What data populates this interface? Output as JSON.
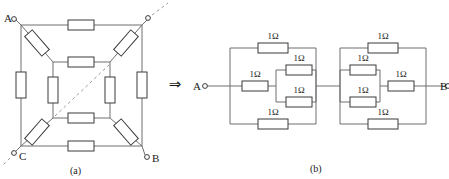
{
  "figure": {
    "caption_a": "(a)",
    "caption_b": "(b)",
    "transform_arrow": "⇒"
  },
  "cube_circuit": {
    "terminals": [
      {
        "id": "A",
        "label": "A",
        "x": 14,
        "y": 19
      },
      {
        "id": "B",
        "label": "B",
        "x": 147,
        "y": 158
      },
      {
        "id": "C",
        "label": "C",
        "x": 14,
        "y": 153
      },
      {
        "id": "D",
        "label": "",
        "x": 148,
        "y": 18
      }
    ],
    "resistor_count": 12,
    "note": "cube of 12 resistors drawn in perspective, dashed hidden edges"
  },
  "equivalent_circuit": {
    "terminal_left": "A",
    "terminal_right": "B",
    "resistor_value": "1Ω",
    "blocks": [
      {
        "name": "left-block",
        "resistors": [
          {
            "pos": "top",
            "value": "1Ω"
          },
          {
            "pos": "middle-series",
            "value": "1Ω"
          },
          {
            "pos": "middle-parallel-upper",
            "value": "1Ω"
          },
          {
            "pos": "middle-parallel-lower",
            "value": "1Ω"
          },
          {
            "pos": "bottom",
            "value": "1Ω"
          }
        ]
      },
      {
        "name": "right-block",
        "resistors": [
          {
            "pos": "top",
            "value": "1Ω"
          },
          {
            "pos": "middle-parallel-upper",
            "value": "1Ω"
          },
          {
            "pos": "middle-parallel-lower",
            "value": "1Ω"
          },
          {
            "pos": "middle-series",
            "value": "1Ω"
          },
          {
            "pos": "bottom",
            "value": "1Ω"
          }
        ]
      }
    ]
  },
  "colors": {
    "wire": "#6f6f6f",
    "resistor_stroke": "#3a3a3a",
    "resistor_fill": "#ffffff",
    "text": "#1a1a1a",
    "dashed": "#9a9a9a"
  }
}
